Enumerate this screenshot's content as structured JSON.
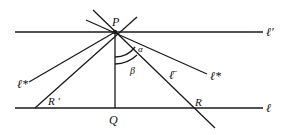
{
  "labels": {
    "P": "P",
    "Q": "Q",
    "R": "R",
    "R_prime": "R '",
    "l_prime": "ℓ'",
    "l": "ℓ",
    "l_star": "ℓ*",
    "l_sub_star": "ℓ*",
    "l_bar": "ℓ̄",
    "alpha": "α",
    "beta": "β"
  },
  "colors": {
    "stroke": "#1a1a1a",
    "background": "#ffffff"
  }
}
